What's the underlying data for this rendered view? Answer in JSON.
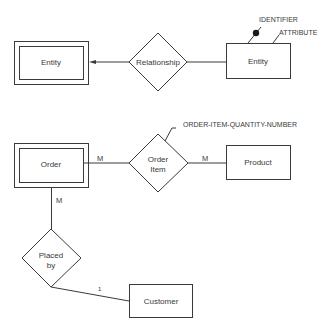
{
  "diagram": {
    "type": "entity-relationship",
    "legend": {
      "weak_entity": {
        "label": "Entity"
      },
      "relationship": {
        "label": "Relationship"
      },
      "entity": {
        "label": "Entity"
      },
      "identifier_label": "IDENTIFIER",
      "attribute_label": "ATTRIBUTE"
    },
    "example": {
      "order": {
        "label": "Order"
      },
      "order_item": {
        "label_line1": "Order",
        "label_line2": "Item"
      },
      "product": {
        "label": "Product"
      },
      "placed_by": {
        "label_line1": "Placed",
        "label_line2": "by"
      },
      "customer": {
        "label": "Customer"
      },
      "order_item_attribute": "ORDER-ITEM-QUANTITY-NUMBER",
      "cardinality": {
        "order_to_order_item": "M",
        "order_item_to_product": "M",
        "order_to_placed_by": "M",
        "placed_by_to_customer": "1"
      }
    },
    "colors": {
      "stroke": "#3a3a3a",
      "background": "#ffffff"
    }
  }
}
